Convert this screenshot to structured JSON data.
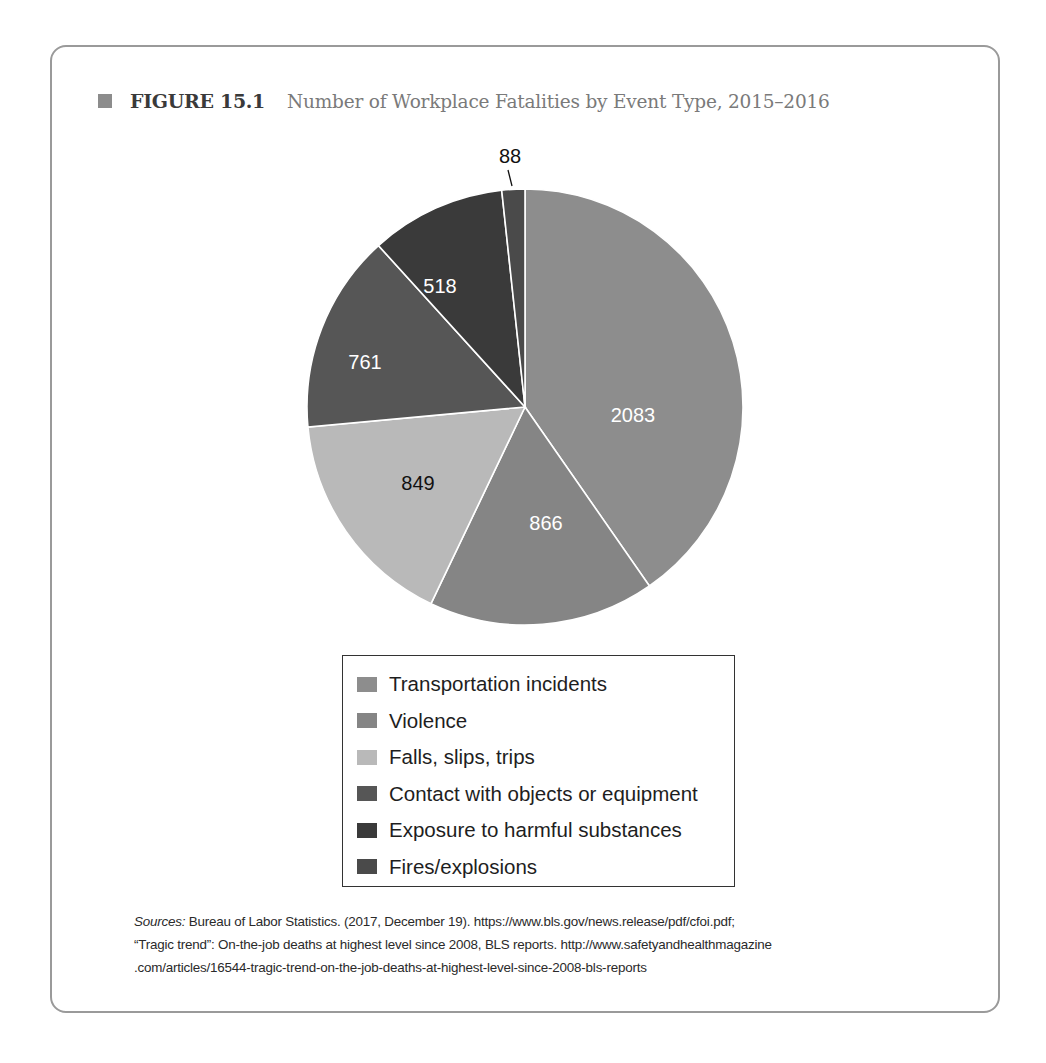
{
  "figure": {
    "label": "FIGURE 15.1",
    "title": "Number of Workplace Fatalities by Event Type, 2015–2016",
    "marker_color": "#8c8c8c"
  },
  "chart_data": {
    "type": "pie",
    "title": "Number of Workplace Fatalities by Event Type, 2015–2016",
    "start_angle_deg": 0,
    "direction": "clockwise",
    "categories": [
      "Transportation incidents",
      "Violence",
      "Falls, slips, trips",
      "Contact with objects or equipment",
      "Exposure to harmful substances",
      "Fires/explosions"
    ],
    "values": [
      2083,
      866,
      849,
      761,
      518,
      88
    ],
    "colors": [
      "#8d8d8d",
      "#858585",
      "#b9b9b9",
      "#565656",
      "#3a3a3a",
      "#4a4a4a"
    ],
    "label_colors": [
      "#ffffff",
      "#ffffff",
      "#111111",
      "#ffffff",
      "#ffffff",
      "#111111"
    ],
    "data_labels": [
      "2083",
      "866",
      "849",
      "761",
      "518",
      "88"
    ],
    "legend_position": "bottom",
    "xlabel": "",
    "ylabel": ""
  },
  "legend": {
    "items": [
      {
        "label": "Transportation incidents",
        "color": "#8d8d8d"
      },
      {
        "label": "Violence",
        "color": "#858585"
      },
      {
        "label": "Falls, slips, trips",
        "color": "#b9b9b9"
      },
      {
        "label": "Contact with objects or equipment",
        "color": "#565656"
      },
      {
        "label": "Exposure to harmful substances",
        "color": "#3a3a3a"
      },
      {
        "label": "Fires/explosions",
        "color": "#4a4a4a"
      }
    ]
  },
  "sources": {
    "lead": "Sources:",
    "line1": " Bureau of Labor Statistics. (2017, December 19). https://www.bls.gov/news.release/pdf/cfoi.pdf;",
    "line2": "“Tragic trend”: On-the-job deaths at highest level since 2008, BLS reports. http://www.safetyandhealthmagazine",
    "line3": ".com/articles/16544-tragic-trend-on-the-job-deaths-at-highest-level-since-2008-bls-reports"
  }
}
